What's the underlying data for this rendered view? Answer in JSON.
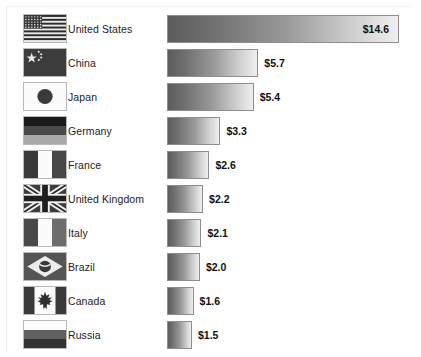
{
  "chart_data": {
    "type": "bar",
    "title": "",
    "subtitle": "",
    "xlabel": "",
    "ylabel": "",
    "orientation": "horizontal",
    "grid": false,
    "legend": false,
    "value_prefix": "$",
    "xlim": [
      0,
      14.6
    ],
    "categories": [
      "United States",
      "China",
      "Japan",
      "Germany",
      "France",
      "United Kingdom",
      "Italy",
      "Brazil",
      "Canada",
      "Russia"
    ],
    "values": [
      14.6,
      5.7,
      5.4,
      3.3,
      2.6,
      2.2,
      2.1,
      2.0,
      1.6,
      1.5
    ],
    "data_labels": [
      "$14.6",
      "$5.7",
      "$5.4",
      "$3.3",
      "$2.6",
      "$2.2",
      "$2.1",
      "$2.0",
      "$1.6",
      "$1.5"
    ],
    "bar_fill": "gradient-dark-gray-to-light-gray",
    "bar_border_color": "#8d8d8d"
  },
  "rows": [
    {
      "country": "United States",
      "label": "United States",
      "value_label": "$14.6",
      "flag": "flag-united-states",
      "label_inside": true
    },
    {
      "country": "China",
      "label": "China",
      "value_label": "$5.7",
      "flag": "flag-china",
      "label_inside": false
    },
    {
      "country": "Japan",
      "label": "Japan",
      "value_label": "$5.4",
      "flag": "flag-japan",
      "label_inside": false
    },
    {
      "country": "Germany",
      "label": "Germany",
      "value_label": "$3.3",
      "flag": "flag-germany",
      "label_inside": false
    },
    {
      "country": "France",
      "label": "France",
      "value_label": "$2.6",
      "flag": "flag-france",
      "label_inside": false
    },
    {
      "country": "United Kingdom",
      "label": "United Kingdom",
      "value_label": "$2.2",
      "flag": "flag-united-kingdom",
      "label_inside": false
    },
    {
      "country": "Italy",
      "label": "Italy",
      "value_label": "$2.1",
      "flag": "flag-italy",
      "label_inside": false
    },
    {
      "country": "Brazil",
      "label": "Brazil",
      "value_label": "$2.0",
      "flag": "flag-brazil",
      "label_inside": false
    },
    {
      "country": "Canada",
      "label": "Canada",
      "value_label": "$1.6",
      "flag": "flag-canada",
      "label_inside": false
    },
    {
      "country": "Russia",
      "label": "Russia",
      "value_label": "$1.5",
      "flag": "flag-russia",
      "label_inside": false
    }
  ]
}
